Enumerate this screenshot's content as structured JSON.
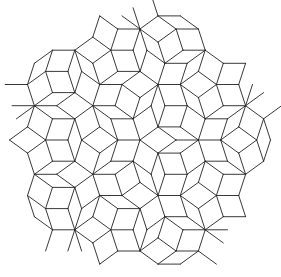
{
  "figure": {
    "title": "Penrose rhombus tiling",
    "background": "#ffffff",
    "stroke_color": "#222222",
    "stroke_width": 0.9,
    "center": [
      140,
      140
    ],
    "edge_length": 20,
    "clip_radius": 122,
    "tile_types": [
      "thick-rhombus",
      "thin-rhombus"
    ]
  }
}
